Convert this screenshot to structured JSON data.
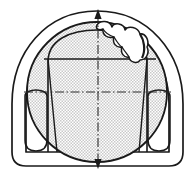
{
  "figure": {
    "type": "engineering-cross-section",
    "canvas": {
      "width": 195,
      "height": 178,
      "background": "#ffffff"
    }
  },
  "colors": {
    "line": "#1a1a1a",
    "fill_shade": "#d9d9d9",
    "fill_shade_dot": "#b8b8b8",
    "background": "#ffffff",
    "centerline": "#3a3a3a"
  },
  "geometry": {
    "outer_shell": {
      "name": "outer-dome-contour",
      "description": "Outer bell/dome profile with flat base and rounded bottom corners",
      "apex_y": 11,
      "base_y": 166,
      "left_x": 12,
      "right_x": 183,
      "corner_radius": 14,
      "stroke_width": 1.6
    },
    "inner_shell": {
      "name": "inner-dome-contour",
      "description": "Inner dome profile offset inward from outer shell",
      "apex_y": 23,
      "base_y": 152,
      "left_x": 26,
      "right_x": 169,
      "stroke_width": 1.6
    },
    "shaded_circle": {
      "name": "shaded-circle",
      "description": "Large halftone-shaded circle inscribed in dome",
      "center_x": 97,
      "center_y": 92,
      "radius": 70,
      "stroke_width": 1.8
    },
    "inner_arc": {
      "name": "inner-arc-contour",
      "description": "Secondary arc forming inner cavity boundary with vertical sides",
      "apex_y": 38,
      "left_x": 48,
      "right_x": 147,
      "bottom_y": 152,
      "stroke_width": 1.5
    },
    "left_leg": {
      "name": "left-leg-profile",
      "description": "Rounded elongated leg/foot shape at lower left",
      "top_y": 96,
      "bottom_y": 150,
      "center_x": 36,
      "half_width": 11
    },
    "right_leg": {
      "name": "right-leg-profile",
      "description": "Rounded elongated leg/foot shape at lower right",
      "top_y": 96,
      "bottom_y": 150,
      "center_x": 159,
      "half_width": 11
    },
    "scallop_region": {
      "name": "scalloped-defect-region",
      "description": "Irregular wavy lobed contour at upper right of circle, three lobes",
      "lobe_count": 3,
      "start_x": 98,
      "start_y": 24,
      "end_x": 146,
      "end_y": 60,
      "stroke_width": 1.5
    }
  },
  "axes": {
    "vertical_centerline": {
      "name": "vertical-centerline",
      "style": "dash-dot",
      "x": 98,
      "y_top": 10,
      "y_bottom": 168,
      "arrow_top": true,
      "arrow_bottom": true
    },
    "horizontal_centerline": {
      "name": "horizontal-centerline",
      "style": "dash-dot",
      "y": 92,
      "x_left": 24,
      "x_right": 171,
      "arrow_left": false,
      "arrow_right": false
    },
    "upper_horizontal_line": {
      "name": "upper-chord-line",
      "style": "solid",
      "y": 59,
      "x_left": 44,
      "x_right": 156
    }
  },
  "construction_lines": [
    {
      "name": "left-construction-line",
      "x1": 48,
      "y1": 59,
      "x2": 56,
      "y2": 152
    },
    {
      "name": "right-construction-line",
      "x1": 147,
      "y1": 59,
      "x2": 140,
      "y2": 152
    }
  ],
  "labels": {
    "figure_caption": "",
    "axis_label_vertical": "",
    "axis_label_horizontal": ""
  },
  "legend": {
    "visible": false,
    "entries": []
  }
}
